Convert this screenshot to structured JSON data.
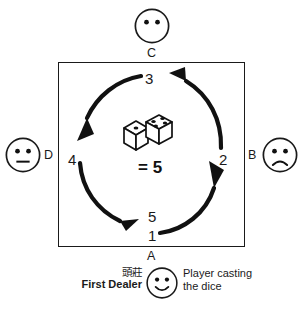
{
  "diagram": {
    "table": {
      "name": "mahjong-table",
      "border_color": "#1a1a1a",
      "background": "#ffffff"
    },
    "seats": [
      {
        "letter": "A",
        "position": "bottom",
        "face": "smiley-neutral-dealer",
        "count_label": "1"
      },
      {
        "letter": "B",
        "position": "right",
        "face": "sad-face",
        "count_label": "2"
      },
      {
        "letter": "C",
        "position": "top",
        "face": "blank-face",
        "count_label": "3"
      },
      {
        "letter": "D",
        "position": "left",
        "face": "straight-face",
        "count_label": "4"
      }
    ],
    "count_sequence": [
      "1",
      "2",
      "3",
      "4",
      "5"
    ],
    "count_direction": "counter-clockwise",
    "arc": {
      "color": "#111111",
      "segments": 4,
      "arrowheads": [
        "toward-2-right",
        "toward-3-top",
        "toward-4-left",
        "toward-5-bottom"
      ]
    },
    "dice": {
      "left_die_top_pips": 1,
      "right_die_top_pips": 4,
      "sum_label": "= 5",
      "sum_value": 5,
      "pip_color": "#111111",
      "body_color": "#ffffff"
    },
    "legend": {
      "first_dealer_cn": "頭莊",
      "first_dealer_en": "First Dealer",
      "caster_line_1": "Player casting",
      "caster_line_2": "the dice",
      "caster_face": "smiling-face"
    }
  }
}
